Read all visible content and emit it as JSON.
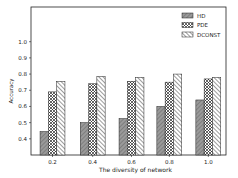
{
  "chart_data": {
    "type": "bar",
    "title": "",
    "xlabel": "The diversity of network",
    "ylabel": "Accuracy",
    "categories": [
      "0.2",
      "0.4",
      "0.6",
      "0.8",
      "1.0"
    ],
    "series": [
      {
        "name": "HD",
        "values": [
          0.445,
          0.5,
          0.525,
          0.6,
          0.64
        ],
        "color": "#999999",
        "hatch": "////"
      },
      {
        "name": "PDE",
        "values": [
          0.69,
          0.74,
          0.755,
          0.75,
          0.77
        ],
        "color": "#ffffff",
        "hatch": "xxxx"
      },
      {
        "name": "DCONST",
        "values": [
          0.755,
          0.785,
          0.78,
          0.8,
          0.78
        ],
        "color": "#ffffff",
        "hatch": "\\\\\\\\"
      }
    ],
    "yticks": [
      "0.4",
      "0.5",
      "0.6",
      "0.7",
      "0.8",
      "0.9",
      "1.0"
    ],
    "ylim": [
      0.3,
      1.15
    ],
    "grid": false,
    "legend_position": "upper right"
  }
}
